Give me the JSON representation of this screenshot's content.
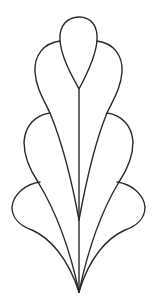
{
  "image": {
    "subject": "leaf-feather-motif",
    "stroke_color": "#2a2a2a",
    "background": "#ffffff",
    "lobes": [
      "top",
      "middle-left",
      "middle-right",
      "lower-left",
      "lower-right",
      "bottom-left",
      "bottom-right"
    ]
  }
}
